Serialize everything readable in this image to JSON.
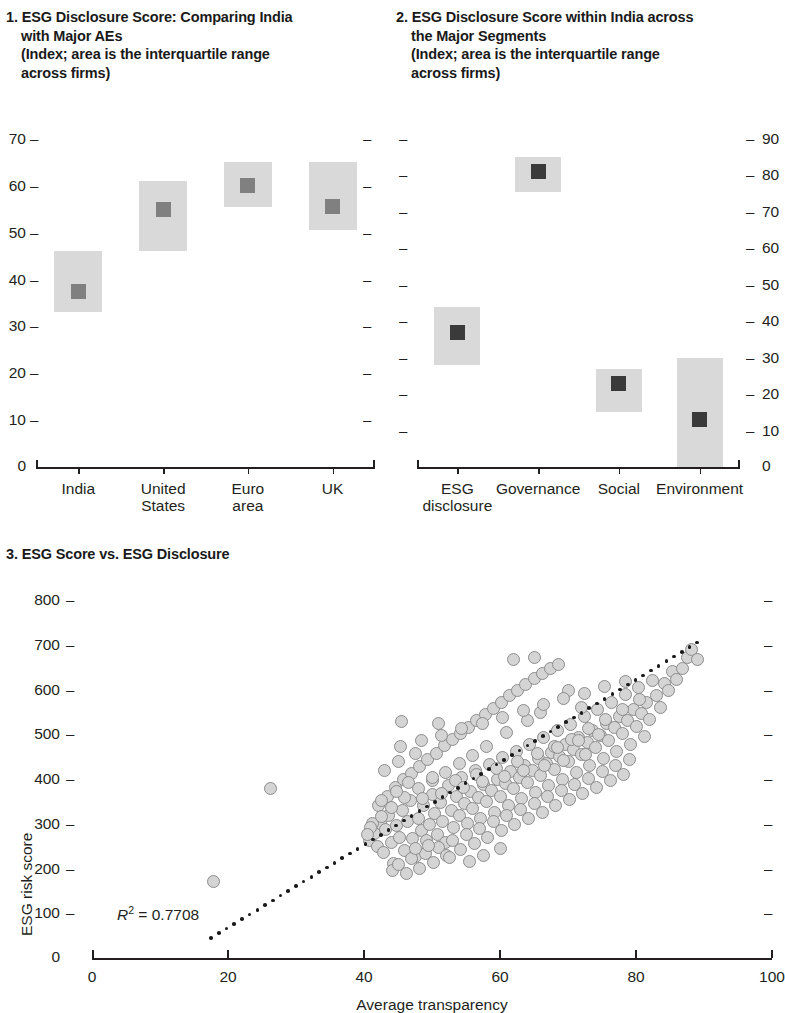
{
  "figure": {
    "panels": [
      {
        "id": "panel-1",
        "number": "1.",
        "title_line1": "ESG Disclosure Score: Comparing India",
        "title_line2": "with Major AEs",
        "subtitle_line1": "(Index; area is the interquartile range",
        "subtitle_line2": "across firms)"
      },
      {
        "id": "panel-2",
        "number": "2.",
        "title_line1": "ESG Disclosure Score within India across",
        "title_line2": "the Major Segments",
        "subtitle_line1": "(Index; area is the interquartile range",
        "subtitle_line2": "across firms)"
      },
      {
        "id": "panel-3",
        "number": "3.",
        "title_line1": "ESG Score vs. ESG Disclosure"
      }
    ]
  },
  "chart_data": [
    {
      "type": "bar",
      "id": "panel-1",
      "title": "1. ESG Disclosure Score: Comparing India with Major AEs",
      "subtitle": "(Index; area is the interquartile range across firms)",
      "xlabel": "",
      "ylabel": "",
      "ylim": [
        0,
        70
      ],
      "yticks": [
        10,
        20,
        30,
        40,
        50,
        60,
        70
      ],
      "ytick_labels": [
        "10",
        "20",
        "30",
        "40",
        "50",
        "60",
        "70"
      ],
      "zero_label": "0",
      "grid": false,
      "legend": "none",
      "categories": [
        "India",
        "United States",
        "Euro area",
        "UK"
      ],
      "category_lines": [
        [
          "India"
        ],
        [
          "United",
          "States"
        ],
        [
          "Euro",
          "area"
        ],
        [
          "UK"
        ]
      ],
      "series": [
        {
          "name": "median",
          "values": [
            37.5,
            55.0,
            60.0,
            55.5
          ]
        },
        {
          "name": "q1",
          "values": [
            33.0,
            46.0,
            55.5,
            50.5
          ]
        },
        {
          "name": "q3",
          "values": [
            46.0,
            61.0,
            65.0,
            65.0
          ]
        }
      ],
      "colors": {
        "box": "#d9d9d9",
        "median": "#808080",
        "axis": "#231f20"
      }
    },
    {
      "type": "bar",
      "id": "panel-2",
      "title": "2. ESG Disclosure Score within India across the Major Segments",
      "subtitle": "(Index; area is the interquartile range across firms)",
      "xlabel": "",
      "ylabel": "",
      "ylim": [
        0,
        90
      ],
      "yticks": [
        10,
        20,
        30,
        40,
        50,
        60,
        70,
        80,
        90
      ],
      "ytick_labels": [
        "10",
        "20",
        "30",
        "40",
        "50",
        "60",
        "70",
        "80",
        "90"
      ],
      "zero_label": "0",
      "y_axis_side": "right",
      "grid": false,
      "legend": "none",
      "categories": [
        "ESG disclosure",
        "Governance",
        "Social",
        "Environment"
      ],
      "category_lines": [
        [
          "ESG",
          "disclosure"
        ],
        [
          "Governance"
        ],
        [
          "Social"
        ],
        [
          "Environment"
        ]
      ],
      "series": [
        {
          "name": "median",
          "values": [
            37.0,
            81.0,
            23.0,
            13.0
          ]
        },
        {
          "name": "q1",
          "values": [
            28.0,
            75.5,
            15.0,
            0.0
          ]
        },
        {
          "name": "q3",
          "values": [
            44.0,
            85.0,
            27.0,
            30.0
          ]
        }
      ],
      "colors": {
        "box": "#d9d9d9",
        "median": "#3a3a3a",
        "axis": "#231f20"
      }
    },
    {
      "type": "scatter",
      "id": "panel-3",
      "title": "3. ESG Score vs. ESG Disclosure",
      "xlabel": "Average transparency",
      "ylabel": "ESG risk score",
      "xlim": [
        0,
        100
      ],
      "ylim": [
        0,
        800
      ],
      "xticks": [
        0,
        20,
        40,
        60,
        80,
        100
      ],
      "xtick_labels": [
        "0",
        "20",
        "40",
        "60",
        "80",
        "100"
      ],
      "yticks": [
        100,
        200,
        300,
        400,
        500,
        600,
        700,
        800
      ],
      "ytick_labels": [
        "100",
        "200",
        "300",
        "400",
        "500",
        "600",
        "700",
        "800"
      ],
      "zero_label": "0",
      "grid": false,
      "legend": "none",
      "annotation": "R2 = 0.7708",
      "annotation_r": "R",
      "annotation_sup": "2",
      "annotation_rest": " = 0.7708",
      "r_squared": 0.7708,
      "trendline": {
        "style": "dotted",
        "x0": 17.5,
        "y0": 45,
        "x1": 89,
        "y1": 705
      },
      "marker": {
        "shape": "circle",
        "fill": "#d4d4d4",
        "edge": "#8c8c8c",
        "size_px": 13
      },
      "points": [
        [
          17.8,
          170
        ],
        [
          26.2,
          378
        ],
        [
          45.5,
          528
        ],
        [
          51.0,
          523
        ],
        [
          40.8,
          262
        ],
        [
          41.5,
          278
        ],
        [
          42.0,
          250
        ],
        [
          42.4,
          300
        ],
        [
          42.8,
          236
        ],
        [
          43.2,
          288
        ],
        [
          43.6,
          318
        ],
        [
          44.0,
          258
        ],
        [
          44.4,
          212
        ],
        [
          44.8,
          296
        ],
        [
          45.2,
          270
        ],
        [
          45.6,
          330
        ],
        [
          46.0,
          240
        ],
        [
          46.4,
          305
        ],
        [
          46.8,
          352
        ],
        [
          47.2,
          268
        ],
        [
          47.6,
          226
        ],
        [
          48.0,
          312
        ],
        [
          48.4,
          284
        ],
        [
          48.8,
          340
        ],
        [
          49.2,
          262
        ],
        [
          49.6,
          298
        ],
        [
          50.0,
          365
        ],
        [
          50.4,
          322
        ],
        [
          50.8,
          276
        ],
        [
          51.2,
          348
        ],
        [
          51.6,
          304
        ],
        [
          52.0,
          258
        ],
        [
          52.4,
          386
        ],
        [
          52.8,
          330
        ],
        [
          53.2,
          292
        ],
        [
          53.6,
          360
        ],
        [
          54.0,
          318
        ],
        [
          54.4,
          404
        ],
        [
          54.8,
          346
        ],
        [
          55.2,
          300
        ],
        [
          55.6,
          372
        ],
        [
          56.0,
          334
        ],
        [
          56.4,
          420
        ],
        [
          56.8,
          358
        ],
        [
          57.2,
          312
        ],
        [
          57.6,
          388
        ],
        [
          58.0,
          350
        ],
        [
          58.4,
          432
        ],
        [
          58.8,
          374
        ],
        [
          59.2,
          326
        ],
        [
          59.6,
          400
        ],
        [
          60.0,
          362
        ],
        [
          60.4,
          448
        ],
        [
          60.8,
          390
        ],
        [
          61.2,
          340
        ],
        [
          61.6,
          416
        ],
        [
          62.0,
          378
        ],
        [
          62.4,
          462
        ],
        [
          62.8,
          404
        ],
        [
          63.2,
          356
        ],
        [
          63.6,
          430
        ],
        [
          64.0,
          392
        ],
        [
          64.4,
          476
        ],
        [
          64.8,
          418
        ],
        [
          65.2,
          370
        ],
        [
          65.6,
          446
        ],
        [
          66.0,
          408
        ],
        [
          66.4,
          492
        ],
        [
          66.8,
          434
        ],
        [
          67.2,
          386
        ],
        [
          67.6,
          460
        ],
        [
          68.0,
          422
        ],
        [
          68.4,
          508
        ],
        [
          68.8,
          450
        ],
        [
          69.2,
          400
        ],
        [
          69.6,
          476
        ],
        [
          70.0,
          438
        ],
        [
          70.4,
          522
        ],
        [
          70.8,
          466
        ],
        [
          71.2,
          414
        ],
        [
          71.6,
          492
        ],
        [
          72.0,
          454
        ],
        [
          72.4,
          540
        ],
        [
          72.8,
          482
        ],
        [
          73.2,
          430
        ],
        [
          73.6,
          508
        ],
        [
          74.0,
          470
        ],
        [
          74.4,
          556
        ],
        [
          74.8,
          498
        ],
        [
          75.2,
          446
        ],
        [
          75.6,
          524
        ],
        [
          76.0,
          486
        ],
        [
          76.4,
          572
        ],
        [
          76.8,
          514
        ],
        [
          77.2,
          462
        ],
        [
          77.6,
          540
        ],
        [
          78.0,
          502
        ],
        [
          78.4,
          588
        ],
        [
          78.8,
          530
        ],
        [
          79.2,
          478
        ],
        [
          79.6,
          556
        ],
        [
          80.0,
          518
        ],
        [
          80.4,
          604
        ],
        [
          80.8,
          546
        ],
        [
          81.2,
          494
        ],
        [
          81.6,
          572
        ],
        [
          82.0,
          534
        ],
        [
          82.4,
          620
        ],
        [
          83.0,
          586
        ],
        [
          83.6,
          560
        ],
        [
          84.2,
          614
        ],
        [
          84.8,
          598
        ],
        [
          85.4,
          640
        ],
        [
          86.0,
          622
        ],
        [
          86.8,
          648
        ],
        [
          87.5,
          672
        ],
        [
          88.2,
          690
        ],
        [
          89.0,
          668
        ],
        [
          44.2,
          196
        ],
        [
          45.0,
          210
        ],
        [
          46.2,
          188
        ],
        [
          47.0,
          222
        ],
        [
          48.2,
          200
        ],
        [
          49.0,
          234
        ],
        [
          50.2,
          214
        ],
        [
          51.0,
          248
        ],
        [
          52.2,
          228
        ],
        [
          53.0,
          262
        ],
        [
          54.2,
          242
        ],
        [
          55.0,
          276
        ],
        [
          56.2,
          256
        ],
        [
          57.0,
          290
        ],
        [
          58.2,
          270
        ],
        [
          59.0,
          304
        ],
        [
          60.2,
          284
        ],
        [
          61.0,
          318
        ],
        [
          62.2,
          298
        ],
        [
          63.0,
          332
        ],
        [
          64.2,
          312
        ],
        [
          65.0,
          346
        ],
        [
          66.2,
          326
        ],
        [
          67.0,
          360
        ],
        [
          68.2,
          340
        ],
        [
          69.0,
          374
        ],
        [
          70.2,
          354
        ],
        [
          71.0,
          388
        ],
        [
          72.2,
          368
        ],
        [
          73.0,
          402
        ],
        [
          74.2,
          382
        ],
        [
          75.0,
          416
        ],
        [
          76.2,
          396
        ],
        [
          77.0,
          430
        ],
        [
          78.2,
          410
        ],
        [
          79.0,
          444
        ],
        [
          41.2,
          300
        ],
        [
          42.2,
          340
        ],
        [
          43.4,
          362
        ],
        [
          44.6,
          380
        ],
        [
          45.8,
          398
        ],
        [
          47.0,
          412
        ],
        [
          48.2,
          428
        ],
        [
          49.4,
          444
        ],
        [
          50.6,
          458
        ],
        [
          51.8,
          474
        ],
        [
          53.0,
          488
        ],
        [
          54.2,
          502
        ],
        [
          55.4,
          516
        ],
        [
          56.6,
          530
        ],
        [
          57.8,
          544
        ],
        [
          59.0,
          558
        ],
        [
          60.2,
          572
        ],
        [
          61.4,
          586
        ],
        [
          62.6,
          598
        ],
        [
          63.8,
          612
        ],
        [
          65.0,
          624
        ],
        [
          66.2,
          636
        ],
        [
          67.4,
          646
        ],
        [
          68.6,
          656
        ],
        [
          62.0,
          668
        ],
        [
          65.0,
          672
        ],
        [
          70.0,
          598
        ],
        [
          72.0,
          560
        ],
        [
          66.0,
          548
        ],
        [
          64.0,
          530
        ],
        [
          61.0,
          504
        ],
        [
          58.0,
          472
        ],
        [
          56.0,
          452
        ],
        [
          54.0,
          434
        ],
        [
          52.0,
          414
        ],
        [
          50.0,
          396
        ],
        [
          48.0,
          378
        ],
        [
          46.0,
          358
        ],
        [
          44.0,
          336
        ],
        [
          42.5,
          316
        ],
        [
          41.0,
          292
        ],
        [
          40.5,
          276
        ],
        [
          52.5,
          224
        ],
        [
          55.5,
          216
        ],
        [
          57.5,
          230
        ],
        [
          60.0,
          244
        ],
        [
          49.5,
          252
        ],
        [
          47.5,
          244
        ],
        [
          68.0,
          472
        ],
        [
          70.5,
          488
        ],
        [
          73.0,
          512
        ],
        [
          75.5,
          534
        ],
        [
          78.0,
          556
        ],
        [
          80.5,
          578
        ],
        [
          43.0,
          420
        ],
        [
          45.0,
          440
        ],
        [
          47.5,
          458
        ],
        [
          50.0,
          404
        ],
        [
          53.5,
          396
        ],
        [
          56.5,
          410
        ],
        [
          59.5,
          424
        ],
        [
          62.5,
          440
        ],
        [
          65.5,
          456
        ],
        [
          68.5,
          470
        ],
        [
          71.5,
          486
        ],
        [
          74.5,
          500
        ],
        [
          42.6,
          352
        ],
        [
          44.8,
          372
        ],
        [
          46.6,
          392
        ],
        [
          48.6,
          356
        ],
        [
          51.4,
          368
        ],
        [
          54.6,
          382
        ],
        [
          57.4,
          394
        ],
        [
          60.6,
          406
        ],
        [
          63.4,
          418
        ],
        [
          66.6,
          430
        ],
        [
          69.4,
          442
        ],
        [
          72.6,
          454
        ],
        [
          45.4,
          472
        ],
        [
          48.4,
          486
        ],
        [
          51.4,
          498
        ],
        [
          54.4,
          512
        ],
        [
          57.4,
          524
        ],
        [
          60.4,
          538
        ],
        [
          63.4,
          552
        ],
        [
          66.4,
          566
        ],
        [
          69.4,
          580
        ],
        [
          72.4,
          592
        ],
        [
          75.4,
          606
        ],
        [
          78.4,
          618
        ]
      ]
    }
  ]
}
